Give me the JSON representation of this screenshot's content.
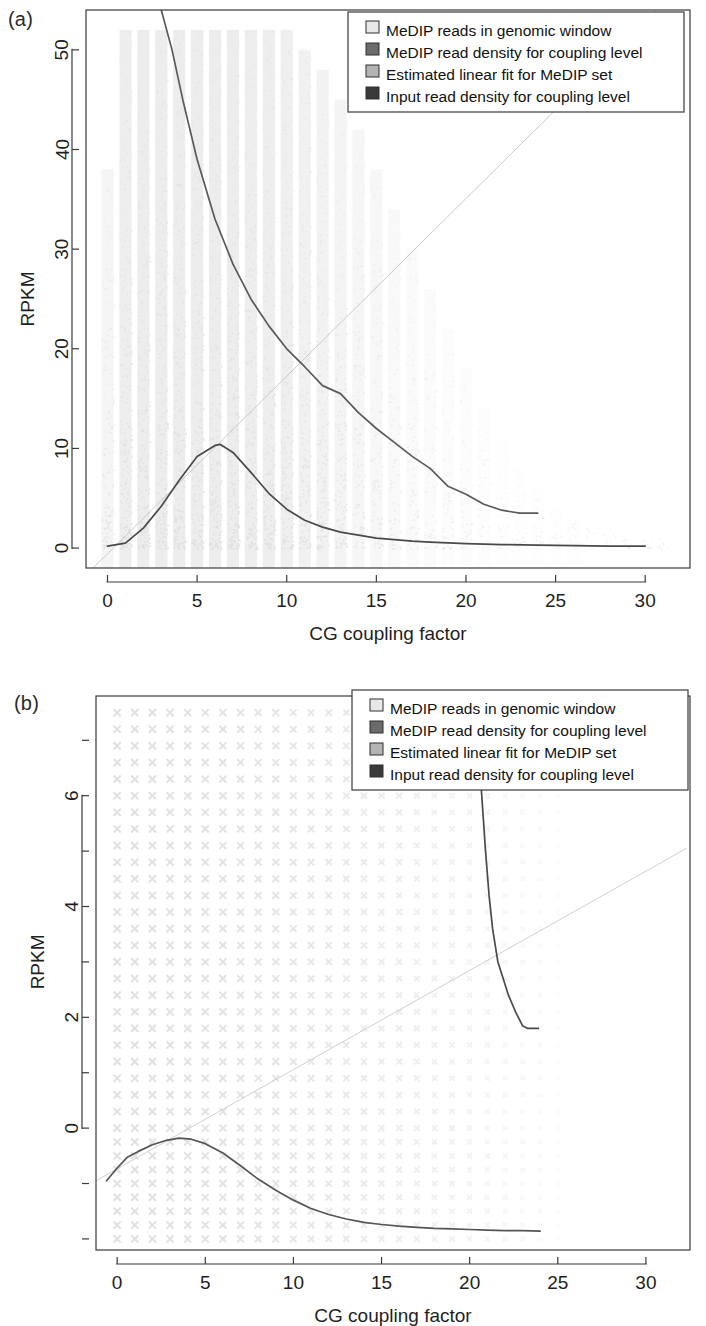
{
  "figure": {
    "panels": [
      {
        "tag": "(a)",
        "xlabel": "CG coupling factor",
        "ylabel": "RPKM"
      },
      {
        "tag": "(b)",
        "xlabel": "CG coupling factor",
        "ylabel": "RPKM"
      }
    ],
    "legend": {
      "items": [
        {
          "label": "MeDIP reads in genomic window",
          "color": "#e8e8e8"
        },
        {
          "label": "MeDIP read density for coupling level",
          "color": "#6b6b6b"
        },
        {
          "label": "Estimated linear fit for MeDIP set",
          "color": "#b4b4b4"
        },
        {
          "label": "Input read density for coupling level",
          "color": "#3a3a3a"
        }
      ]
    }
  },
  "chart_data": [
    {
      "type": "scatter",
      "panel": "(a)",
      "title": "",
      "xlabel": "CG coupling factor",
      "ylabel": "RPKM",
      "xlim": [
        -1.2,
        32.5
      ],
      "ylim": [
        -2.0,
        54.0
      ],
      "xticks": [
        0,
        5,
        10,
        15,
        20,
        25,
        30
      ],
      "xtick_labels": [
        "0",
        "5",
        "10",
        "15",
        "20",
        "25",
        "30"
      ],
      "yticks": [
        0,
        10,
        20,
        30,
        40,
        50
      ],
      "ytick_labels": [
        "0",
        "10",
        "20",
        "30",
        "40",
        "50"
      ],
      "grid": false,
      "legend_position": "top-right",
      "series": [
        {
          "name": "MeDIP reads in genomic window",
          "type": "scatter",
          "marker": "x",
          "color": "#dedede",
          "note": "Dense vertical stripes of points at each integer CG coupling factor; density highest near low RPKM, thinning toward high RPKM and high coupling factor.",
          "stripes": [
            {
              "x": 0,
              "ymax": 38,
              "density": 0.55
            },
            {
              "x": 1,
              "ymax": 52,
              "density": 0.95
            },
            {
              "x": 2,
              "ymax": 52,
              "density": 1.0
            },
            {
              "x": 3,
              "ymax": 52,
              "density": 1.0
            },
            {
              "x": 4,
              "ymax": 52,
              "density": 1.0
            },
            {
              "x": 5,
              "ymax": 52,
              "density": 1.0
            },
            {
              "x": 6,
              "ymax": 52,
              "density": 1.0
            },
            {
              "x": 7,
              "ymax": 52,
              "density": 0.98
            },
            {
              "x": 8,
              "ymax": 52,
              "density": 0.96
            },
            {
              "x": 9,
              "ymax": 52,
              "density": 0.92
            },
            {
              "x": 10,
              "ymax": 52,
              "density": 0.88
            },
            {
              "x": 11,
              "ymax": 50,
              "density": 0.8
            },
            {
              "x": 12,
              "ymax": 48,
              "density": 0.72
            },
            {
              "x": 13,
              "ymax": 45,
              "density": 0.62
            },
            {
              "x": 14,
              "ymax": 42,
              "density": 0.52
            },
            {
              "x": 15,
              "ymax": 38,
              "density": 0.44
            },
            {
              "x": 16,
              "ymax": 34,
              "density": 0.36
            },
            {
              "x": 17,
              "ymax": 30,
              "density": 0.29
            },
            {
              "x": 18,
              "ymax": 26,
              "density": 0.23
            },
            {
              "x": 19,
              "ymax": 22,
              "density": 0.18
            },
            {
              "x": 20,
              "ymax": 18,
              "density": 0.14
            },
            {
              "x": 21,
              "ymax": 14,
              "density": 0.1
            },
            {
              "x": 22,
              "ymax": 11,
              "density": 0.08
            },
            {
              "x": 23,
              "ymax": 8,
              "density": 0.06
            },
            {
              "x": 24,
              "ymax": 6,
              "density": 0.05
            },
            {
              "x": 25,
              "ymax": 4,
              "density": 0.04
            },
            {
              "x": 26,
              "ymax": 3,
              "density": 0.03
            },
            {
              "x": 27,
              "ymax": 2,
              "density": 0.02
            },
            {
              "x": 28,
              "ymax": 2,
              "density": 0.02
            },
            {
              "x": 29,
              "ymax": 1,
              "density": 0.015
            },
            {
              "x": 30,
              "ymax": 1,
              "density": 0.01
            },
            {
              "x": 31,
              "ymax": 1,
              "density": 0.008
            }
          ]
        },
        {
          "name": "MeDIP read density for coupling level",
          "type": "line",
          "color": "#5a5a5a",
          "x": [
            3.0,
            3.6,
            4.2,
            5.0,
            6.0,
            7.0,
            8.0,
            9.0,
            10.0,
            11.0,
            12.0,
            13.0,
            14.0,
            15.0,
            16.0,
            17.0,
            18.0,
            19.0,
            20.0,
            21.0,
            22.0,
            23.0,
            24.0
          ],
          "y": [
            54.0,
            50.0,
            45.0,
            39.0,
            33.0,
            28.5,
            25.0,
            22.3,
            20.0,
            18.2,
            16.3,
            15.5,
            13.6,
            12.0,
            10.6,
            9.2,
            8.0,
            6.2,
            5.4,
            4.4,
            3.8,
            3.5,
            3.5
          ]
        },
        {
          "name": "Estimated linear fit for MeDIP set",
          "type": "line",
          "color": "#c2c2c2",
          "x": [
            -0.8,
            32.3
          ],
          "y": [
            -2.0,
            57.0
          ],
          "slope": 1.78,
          "intercept": -0.6
        },
        {
          "name": "Input read density for coupling level",
          "type": "line",
          "color": "#4a4a4a",
          "x": [
            0.0,
            1.0,
            2.0,
            3.0,
            4.0,
            5.0,
            6.0,
            6.3,
            7.0,
            8.0,
            9.0,
            10.0,
            11.0,
            12.0,
            13.0,
            14.0,
            15.0,
            16.0,
            17.0,
            18.0,
            20.0,
            22.0,
            24.0,
            26.0,
            28.0,
            30.0
          ],
          "y": [
            0.2,
            0.5,
            2.0,
            4.2,
            6.8,
            9.2,
            10.3,
            10.4,
            9.6,
            7.6,
            5.5,
            3.9,
            2.8,
            2.1,
            1.6,
            1.3,
            1.0,
            0.85,
            0.7,
            0.6,
            0.45,
            0.35,
            0.3,
            0.25,
            0.2,
            0.2
          ]
        }
      ]
    },
    {
      "type": "scatter",
      "panel": "(b)",
      "title": "",
      "xlabel": "CG coupling factor",
      "ylabel": "RPKM",
      "xlim": [
        -1.2,
        32.5
      ],
      "ylim": [
        -2.2,
        7.8
      ],
      "xticks": [
        0,
        5,
        10,
        15,
        20,
        25,
        30
      ],
      "xtick_labels": [
        "0",
        "5",
        "10",
        "15",
        "20",
        "25",
        "30"
      ],
      "yticks": [
        0,
        2,
        4,
        6
      ],
      "ytick_labels": [
        "0",
        "2",
        "4",
        "6"
      ],
      "yticks_minor": [
        -2,
        -1,
        1,
        3,
        5,
        7
      ],
      "grid": false,
      "legend_position": "top-right",
      "series": [
        {
          "name": "MeDIP reads in genomic window",
          "type": "scatter",
          "marker": "x",
          "color": "#dcdcdc",
          "note": "Regular grid of X markers at discrete log-spaced RPKM levels for each integer coupling factor; fades out with increasing coupling factor.",
          "grid_x": [
            0,
            1,
            2,
            3,
            4,
            5,
            6,
            7,
            8,
            9,
            10,
            11,
            12,
            13,
            14,
            15,
            16,
            17,
            18,
            19,
            20,
            21,
            22,
            23,
            24,
            25,
            26,
            27,
            28,
            29,
            30
          ],
          "grid_y_levels": [
            -2.0,
            -1.75,
            -1.5,
            -1.25,
            -1.0,
            -0.75,
            -0.5,
            -0.25,
            0.0,
            0.3,
            0.6,
            0.9,
            1.2,
            1.5,
            1.8,
            2.1,
            2.4,
            2.7,
            3.0,
            3.3,
            3.6,
            3.9,
            4.2,
            4.5,
            4.8,
            5.1,
            5.4,
            5.7,
            6.0,
            6.3,
            6.6,
            6.9,
            7.2,
            7.5
          ]
        },
        {
          "name": "MeDIP read density for coupling level",
          "type": "line",
          "color": "#4a4a4a",
          "x": [
            20.3,
            20.6,
            20.9,
            21.1,
            21.3,
            21.6,
            21.9,
            22.2,
            22.6,
            23.0,
            23.3,
            23.9
          ],
          "y": [
            7.8,
            6.4,
            5.0,
            4.2,
            3.6,
            3.0,
            2.7,
            2.4,
            2.1,
            1.85,
            1.8,
            1.8
          ]
        },
        {
          "name": "Estimated linear fit for MeDIP set",
          "type": "line",
          "color": "#c8c8c8",
          "x": [
            -1.2,
            32.3
          ],
          "y": [
            -0.95,
            5.05
          ],
          "slope": 0.179,
          "intercept": -0.74
        },
        {
          "name": "Input read density for coupling level",
          "type": "line",
          "color": "#555555",
          "x": [
            -0.6,
            0.0,
            0.6,
            1.2,
            2.0,
            2.8,
            3.5,
            4.2,
            5.0,
            6.0,
            7.0,
            8.0,
            9.0,
            10.0,
            11.0,
            12.0,
            13.0,
            14.0,
            15.0,
            16.0,
            17.0,
            18.0,
            19.0,
            20.0,
            21.0,
            22.0,
            23.0,
            24.0
          ],
          "y": [
            -0.95,
            -0.72,
            -0.52,
            -0.42,
            -0.3,
            -0.22,
            -0.18,
            -0.2,
            -0.28,
            -0.45,
            -0.68,
            -0.92,
            -1.12,
            -1.3,
            -1.45,
            -1.56,
            -1.64,
            -1.7,
            -1.74,
            -1.77,
            -1.79,
            -1.81,
            -1.82,
            -1.83,
            -1.84,
            -1.85,
            -1.85,
            -1.86
          ]
        }
      ]
    }
  ]
}
